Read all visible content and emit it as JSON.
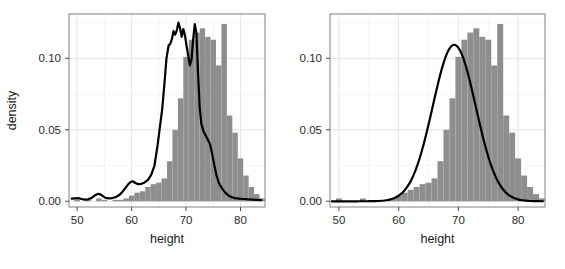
{
  "figure": {
    "panel_count": 2,
    "background": "#ffffff",
    "bar_color": "#8e8e8e",
    "line_color": "#000000",
    "grid_color": "#e2e2e2",
    "border_color": "#8c8c8c"
  },
  "chart_data": [
    {
      "id": "left-panel",
      "type": "histogram-density",
      "title": "",
      "xlabel": "height",
      "ylabel": "density",
      "xlim": [
        48.5,
        84.5
      ],
      "ylim": [
        -0.004,
        0.131
      ],
      "xticks": [
        50,
        60,
        70,
        80
      ],
      "xtick_labels": [
        "50",
        "60",
        "70",
        "80"
      ],
      "yticks": [
        0.0,
        0.05,
        0.1
      ],
      "ytick_labels": [
        "0.00",
        "0.05",
        "0.10"
      ],
      "grid": true,
      "binwidth": 1.0,
      "bins_start": 49.5,
      "hist_values": [
        0.001,
        0.0,
        0.001,
        0.0,
        0.002,
        0.001,
        0.0,
        0.001,
        0.001,
        0.002,
        0.004,
        0.006,
        0.007,
        0.01,
        0.012,
        0.013,
        0.016,
        0.028,
        0.05,
        0.072,
        0.101,
        0.113,
        0.118,
        0.121,
        0.115,
        0.113,
        0.095,
        0.124,
        0.06,
        0.048,
        0.03,
        0.018,
        0.01,
        0.005,
        0.002
      ],
      "density_x": [
        49.0,
        49.6,
        50.2,
        50.8,
        51.4,
        52.0,
        52.6,
        53.2,
        53.8,
        54.2,
        54.6,
        55.2,
        55.8,
        56.4,
        57.0,
        57.6,
        58.2,
        58.8,
        59.3,
        59.8,
        60.2,
        60.7,
        61.2,
        61.8,
        62.4,
        63.0,
        63.6,
        64.2,
        64.8,
        65.2,
        65.6,
        66.0,
        66.4,
        66.8,
        67.1,
        67.4,
        67.7,
        68.0,
        68.3,
        68.6,
        68.9,
        69.2,
        69.5,
        69.8,
        70.1,
        70.4,
        70.7,
        71.0,
        71.3,
        71.6,
        71.9,
        72.2,
        72.5,
        72.8,
        73.2,
        73.6,
        74.0,
        74.4,
        74.8,
        75.2,
        75.6,
        76.0,
        76.6,
        77.2,
        77.8,
        78.4,
        79.0,
        79.8,
        80.6,
        81.4,
        82.2,
        83.0,
        83.8
      ],
      "density_y": [
        0.0018,
        0.002,
        0.0022,
        0.0016,
        0.0012,
        0.0014,
        0.0022,
        0.004,
        0.0052,
        0.005,
        0.004,
        0.0024,
        0.002,
        0.0022,
        0.0028,
        0.004,
        0.006,
        0.009,
        0.0115,
        0.0135,
        0.014,
        0.0128,
        0.012,
        0.0122,
        0.0132,
        0.015,
        0.0185,
        0.025,
        0.04,
        0.052,
        0.064,
        0.081,
        0.1,
        0.109,
        0.11,
        0.1135,
        0.119,
        0.1165,
        0.1195,
        0.125,
        0.121,
        0.115,
        0.1205,
        0.116,
        0.1085,
        0.102,
        0.095,
        0.099,
        0.113,
        0.124,
        0.118,
        0.09,
        0.066,
        0.0545,
        0.049,
        0.046,
        0.043,
        0.04,
        0.033,
        0.025,
        0.018,
        0.013,
        0.009,
        0.006,
        0.004,
        0.0028,
        0.0022,
        0.0018,
        0.0016,
        0.0014,
        0.0012,
        0.001,
        0.0008
      ]
    },
    {
      "id": "right-panel",
      "type": "histogram-density",
      "title": "",
      "xlabel": "height",
      "ylabel": "density",
      "xlim": [
        48.5,
        84.5
      ],
      "ylim": [
        -0.004,
        0.131
      ],
      "xticks": [
        50,
        60,
        70,
        80
      ],
      "xtick_labels": [
        "50",
        "60",
        "70",
        "80"
      ],
      "yticks": [
        0.0,
        0.05,
        0.1
      ],
      "ytick_labels": [
        "0.00",
        "0.05",
        "0.10"
      ],
      "grid": true,
      "binwidth": 1.0,
      "bins_start": 49.5,
      "hist_values": [
        0.002,
        0.0,
        0.0,
        0.0,
        0.002,
        0.0,
        0.0,
        0.0,
        0.001,
        0.002,
        0.004,
        0.006,
        0.008,
        0.01,
        0.012,
        0.013,
        0.016,
        0.028,
        0.05,
        0.072,
        0.101,
        0.113,
        0.118,
        0.121,
        0.115,
        0.113,
        0.095,
        0.124,
        0.06,
        0.048,
        0.03,
        0.018,
        0.01,
        0.005,
        0.002
      ],
      "normal_fit": {
        "mean": 69.3,
        "sd": 3.6,
        "peak": 0.1095,
        "label": "normal density overlay"
      }
    }
  ]
}
